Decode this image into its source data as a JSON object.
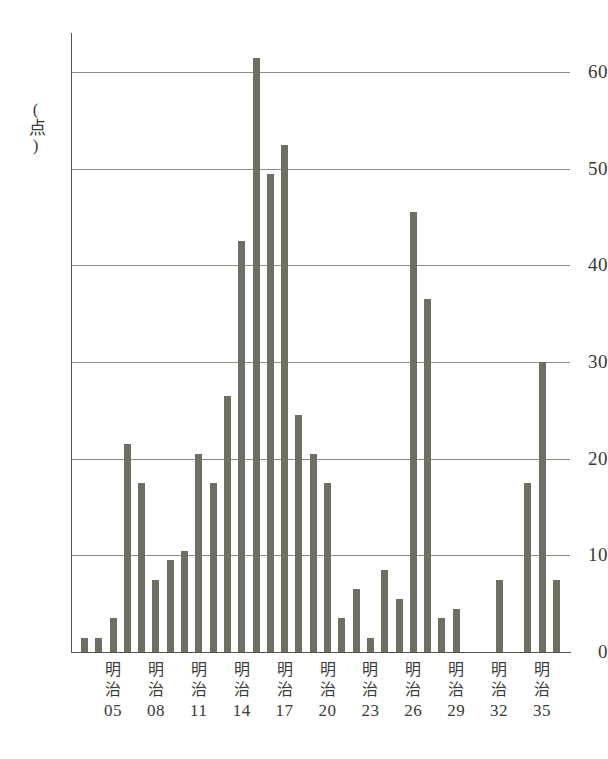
{
  "chart_data": {
    "type": "bar",
    "title": "",
    "subtitle": "",
    "xlabel": "",
    "ylabel": "(点)",
    "ylim": [
      0,
      66
    ],
    "y_ticks": [
      0,
      10,
      20,
      30,
      40,
      50,
      60
    ],
    "grid": true,
    "legend": null,
    "bar_color": "#6e6e63",
    "grid_color": "#8e8e86",
    "axis_color": "#55554e",
    "era_label": "明治",
    "x_tick_labels": [
      "05",
      "08",
      "11",
      "14",
      "17",
      "20",
      "23",
      "26",
      "29",
      "32",
      "35"
    ],
    "x_tick_years": [
      5,
      8,
      11,
      14,
      17,
      20,
      23,
      26,
      29,
      32,
      35
    ],
    "categories": [
      "明治03",
      "明治04",
      "明治05",
      "明治06",
      "明治07",
      "明治08",
      "明治09",
      "明治10",
      "明治11",
      "明治12",
      "明治13",
      "明治14",
      "明治15",
      "明治16",
      "明治17",
      "明治18",
      "明治19",
      "明治20",
      "明治21",
      "明治22",
      "明治23",
      "明治24",
      "明治25",
      "明治26",
      "明治27",
      "明治28",
      "明治29",
      "明治30",
      "明治31",
      "明治32",
      "明治33",
      "明治34",
      "明治35",
      "明治36"
    ],
    "values": [
      1.5,
      1.5,
      3.5,
      21.5,
      17.5,
      7.5,
      9.5,
      10.5,
      20.5,
      17.5,
      26.5,
      42.5,
      61.5,
      49.5,
      52.5,
      24.5,
      20.5,
      17.5,
      3.5,
      6.5,
      1.5,
      8.5,
      5.5,
      45.5,
      36.5,
      3.5,
      4.5,
      0,
      0,
      7.5,
      0,
      17.5,
      30.0,
      7.5
    ],
    "x_years": [
      3,
      4,
      5,
      6,
      7,
      8,
      9,
      10,
      11,
      12,
      13,
      14,
      15,
      16,
      17,
      18,
      19,
      20,
      21,
      22,
      23,
      24,
      25,
      26,
      27,
      28,
      29,
      30,
      31,
      32,
      33,
      34,
      35,
      36
    ]
  }
}
